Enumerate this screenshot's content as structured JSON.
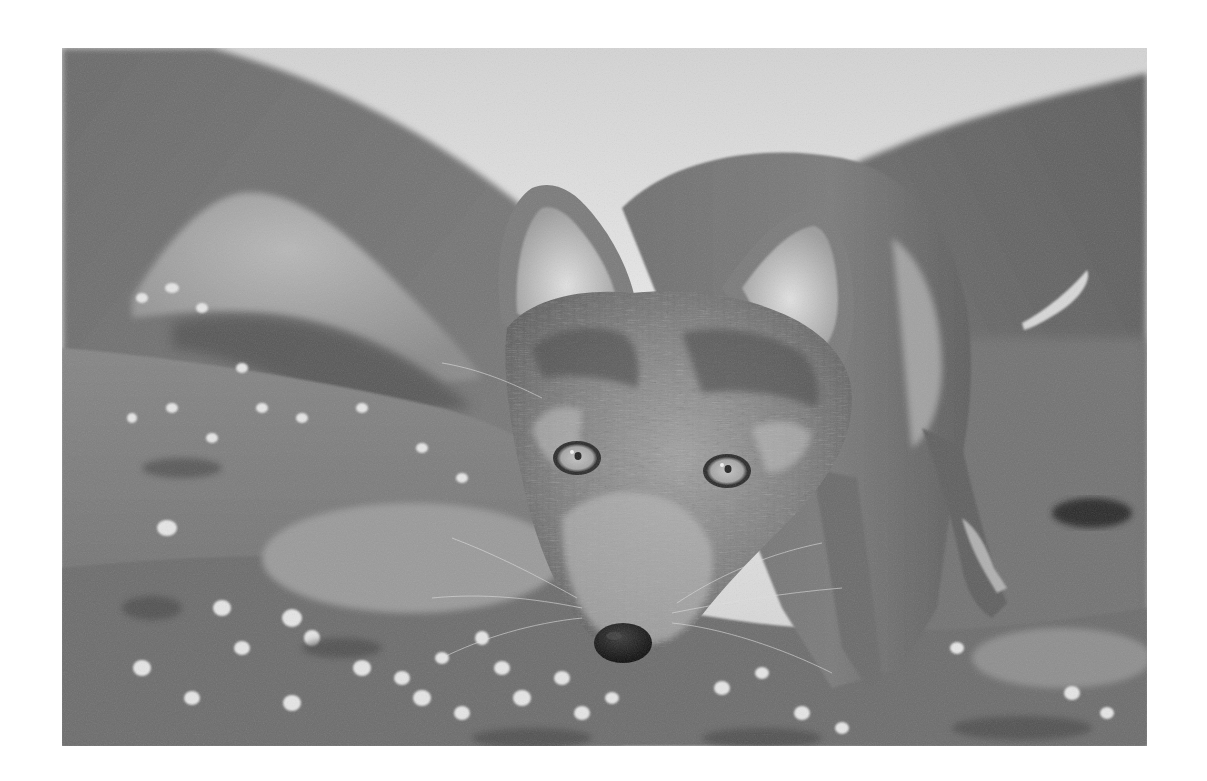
{
  "photo": {
    "subject": "Arctic fox close-up, looking into camera, on tundra with small white flowers",
    "style": "black-and-white photograph",
    "frame": {
      "x": 62,
      "y": 48,
      "width": 1085,
      "height": 698
    },
    "background_color": "#ffffff",
    "palette": {
      "sky": "#e4e4e4",
      "sky_dark": "#c9c9c9",
      "mountain_left": "#6e6e6e",
      "mountain_right": "#636363",
      "rock": "#a8a8a8",
      "ground": "#7c7c7c",
      "ground_dark": "#4f4f4f",
      "fur_dark": "#5a5a5a",
      "fur_mid": "#8a8a8a",
      "fur_light": "#d2d2d2",
      "eye": "#b4b4b4",
      "pupil": "#222222",
      "nose": "#161616",
      "flower": "#e6e6e6"
    }
  }
}
